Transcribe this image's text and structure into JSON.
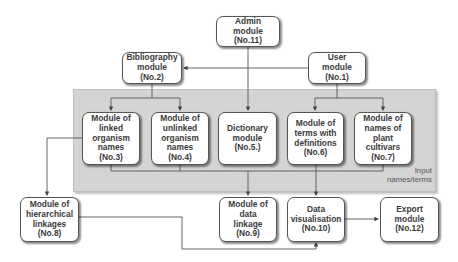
{
  "diagram": {
    "panel_label": "Input\nnames/terms",
    "modules": {
      "admin": {
        "label": "Admin\nmodule\n(No.11)"
      },
      "bibliography": {
        "label": "Bibliography\nmodule\n(No.2)"
      },
      "user": {
        "label": "User\nmodule\n(No.1)"
      },
      "linked": {
        "label": "Module of\nlinked\norganism\nnames\n(No.3)"
      },
      "unlinked": {
        "label": "Module of\nunlinked\norganism\nnames\n(No.4)"
      },
      "dictionary": {
        "label": "Dictionary\nmodule\n(No.5.)"
      },
      "terms": {
        "label": "Module of\nterms with\ndefinitions\n(No.6)"
      },
      "cultivars": {
        "label": "Module of\nnames of plant\ncultivars\n(No.7)"
      },
      "hierarchical": {
        "label": "Module of\nhierarchical\nlinkages\n(No.8)"
      },
      "data_linkage": {
        "label": "Module of\ndata\nlinkage\n(No.9)"
      },
      "visualisation": {
        "label": "Data\nvisualisation\n(No.10)"
      },
      "export": {
        "label": "Export\nmodule\n(No.12)"
      }
    },
    "edges": [
      [
        "User module (No.1)",
        "Bibliography module (No.2)"
      ],
      [
        "Admin module (No.11)",
        "Dictionary module (No.5.)"
      ],
      [
        "Bibliography module (No.2)",
        "Module of linked organism names (No.3)"
      ],
      [
        "Bibliography module (No.2)",
        "Module of unlinked organism names (No.4)"
      ],
      [
        "User module (No.1)",
        "Module of terms with definitions (No.6)"
      ],
      [
        "User module (No.1)",
        "Module of names of plant cultivars (No.7)"
      ],
      [
        "Module of linked organism names (No.3)",
        "Module of hierarchical linkages (No.8)"
      ],
      [
        "Input names/terms",
        "Module of data linkage (No.9)"
      ],
      [
        "Input names/terms",
        "Data visualisation (No.10)"
      ],
      [
        "Module of hierarchical linkages (No.8)",
        "Data visualisation (No.10)"
      ],
      [
        "Data visualisation (No.10)",
        "Export module (No.12)"
      ]
    ]
  }
}
